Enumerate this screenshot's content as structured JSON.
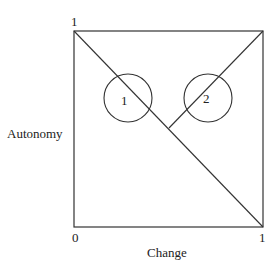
{
  "diagram": {
    "y_axis_label": "Autonomy",
    "x_axis_label": "Change",
    "origin_label": "0",
    "y_max_label": "1",
    "x_max_label": "1",
    "regions": [
      {
        "id": "1",
        "label": "1"
      },
      {
        "id": "2",
        "label": "2"
      }
    ]
  }
}
